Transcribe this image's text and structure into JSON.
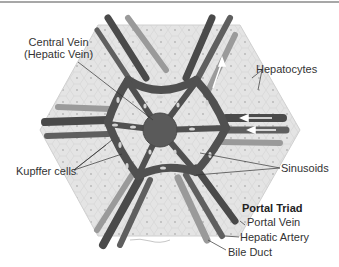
{
  "figure": {
    "colors": {
      "background": "#ffffff",
      "top_rule": "#8a8a8a",
      "hexagon_fill": "#e2e2e2",
      "hexagon_stroke": "#d0d0d0",
      "central_vein": "#5a5a5a",
      "portal_vein": "#4a4a4a",
      "hepatic_artery": "#5f5f5f",
      "bile_duct": "#9a9a9a",
      "sinusoid": "#505050",
      "kupffer_cell": "#cfcfcf",
      "label_text": "#333333",
      "leader_line": "#333333"
    }
  },
  "labels": {
    "central_vein_line1": "Central Vein",
    "central_vein_line2": "(Hepatic Vein)",
    "hepatocytes": "Hepatocytes",
    "kupffer_cells": "Kupffer cells",
    "sinusoids": "Sinusoids",
    "portal_triad": "Portal Triad",
    "portal_vein": "Portal Vein",
    "hepatic_artery": "Hepatic Artery",
    "bile_duct": "Bile Duct"
  }
}
